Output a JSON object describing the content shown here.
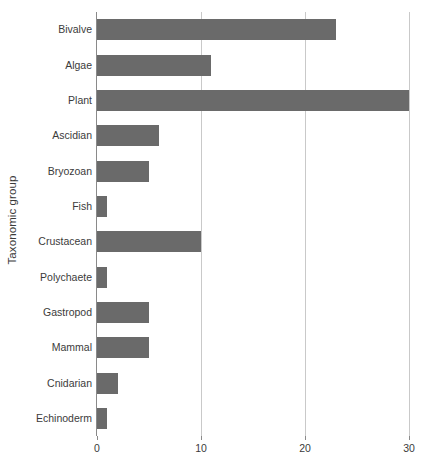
{
  "chart_data": {
    "type": "bar",
    "orientation": "horizontal",
    "title": "",
    "subtitle": "",
    "xlabel": "",
    "ylabel": "Taxonomic group",
    "categories": [
      "Bivalve",
      "Algae",
      "Plant",
      "Ascidian",
      "Bryozoan",
      "Fish",
      "Crustacean",
      "Polychaete",
      "Gastropod",
      "Mammal",
      "Cnidarian",
      "Echinoderm"
    ],
    "values": [
      23,
      11,
      30,
      6,
      5,
      1,
      10,
      1,
      5,
      5,
      2,
      1
    ],
    "xlim": [
      0,
      30
    ],
    "xticks": [
      0,
      10,
      20,
      30
    ],
    "xtick_labels": [
      "0",
      "10",
      "20",
      "30"
    ],
    "grid": "vertical-only",
    "legend": "none",
    "bar_color": "#6a6a6a",
    "gridline_color": "#c9c9c9",
    "axis_color": "#8a8a8a",
    "text_color": "#3b3b3b",
    "background_color": "#ffffff"
  }
}
